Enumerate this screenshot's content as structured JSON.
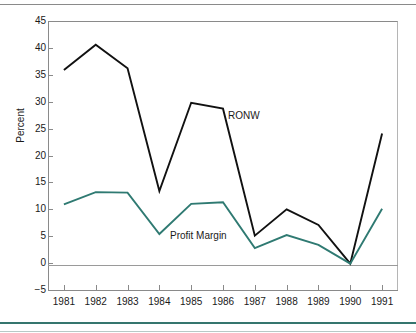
{
  "chart_data": {
    "type": "line",
    "title": "",
    "xlabel": "",
    "ylabel": "Percent",
    "categories": [
      "1981",
      "1982",
      "1983",
      "1984",
      "1985",
      "1986",
      "1987",
      "1988",
      "1989",
      "1990",
      "1991"
    ],
    "x": [
      1981,
      1982,
      1983,
      1984,
      1985,
      1986,
      1987,
      1988,
      1989,
      1990,
      1991
    ],
    "ylim": [
      -5,
      45
    ],
    "yticks": [
      45,
      40,
      35,
      30,
      25,
      20,
      15,
      10,
      5,
      0,
      -5
    ],
    "ytick_labels": [
      "45",
      "40",
      "35",
      "30",
      "25",
      "20",
      "15",
      "10",
      "5",
      "0",
      "−5"
    ],
    "grid": false,
    "legend_position": "inline-annotations",
    "series": [
      {
        "name": "RONW",
        "color": "#111111",
        "values": [
          35.9,
          40.6,
          36.2,
          13.4,
          29.8,
          28.7,
          5.1,
          10.0,
          7.1,
          -0.1,
          24.1
        ]
      },
      {
        "name": "Profit Margin",
        "color": "#2f7a72",
        "values": [
          10.9,
          13.2,
          13.1,
          5.4,
          11.0,
          11.3,
          2.8,
          5.2,
          3.4,
          -0.1,
          10.1
        ]
      }
    ],
    "annotations": [
      {
        "text": "RONW",
        "series": "RONW"
      },
      {
        "text": "Profit Margin",
        "series": "Profit Margin"
      }
    ]
  },
  "colors": {
    "ronw_line": "#111111",
    "profit_line": "#2f7a72",
    "axis": "#8a8a8a",
    "zero_line": "#9a9a9a",
    "rule_accent": "#35756e",
    "text": "#1a1a1a"
  },
  "axis": {
    "y_title": "Percent"
  }
}
